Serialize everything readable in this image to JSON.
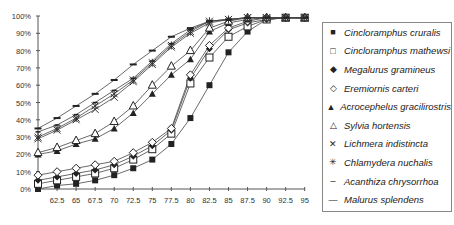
{
  "chart_data": {
    "type": "line",
    "title": "",
    "xlabel": "",
    "ylabel": "",
    "ylim": [
      0,
      100
    ],
    "grid": false,
    "legend_position": "right",
    "y_ticks": [
      "0%",
      "10%",
      "20%",
      "30%",
      "40%",
      "50%",
      "60%",
      "70%",
      "80%",
      "90%",
      "100%"
    ],
    "x": [
      60,
      62.5,
      65,
      67.5,
      70,
      72.5,
      75,
      77.5,
      80,
      82.5,
      85,
      87.5,
      90,
      92.5,
      95
    ],
    "x_tick_labels": [
      "62.5",
      "65",
      "67.5",
      "70",
      "72.5",
      "75",
      "77.5",
      "80",
      "82.5",
      "85",
      "87.5",
      "90",
      "92.5",
      "95"
    ],
    "series": [
      {
        "name": "Cincloramphus cruralis",
        "marker": "filled-square",
        "values": [
          0,
          2,
          3,
          5,
          8,
          12,
          17,
          26,
          41,
          60,
          79,
          91,
          98,
          99,
          99
        ]
      },
      {
        "name": "Cincloramphus mathewsi",
        "marker": "open-square",
        "values": [
          3,
          5,
          7,
          9,
          12,
          17,
          23,
          32,
          61,
          76,
          88,
          94,
          98,
          99,
          99
        ]
      },
      {
        "name": "Megalurus gramineus",
        "marker": "filled-diamond",
        "values": [
          5,
          7,
          9,
          11,
          14,
          19,
          25,
          34,
          64,
          81,
          92,
          96,
          98,
          99,
          99
        ]
      },
      {
        "name": "Eremiornis carteri",
        "marker": "open-diamond",
        "values": [
          8,
          10,
          12,
          14,
          16,
          21,
          27,
          35,
          66,
          83,
          93,
          97,
          99,
          99,
          99
        ]
      },
      {
        "name": "Acrocephelus gracilirostris",
        "marker": "filled-triangle",
        "values": [
          20,
          22,
          26,
          29,
          35,
          44,
          55,
          66,
          75,
          91,
          96,
          98,
          99,
          99,
          99
        ]
      },
      {
        "name": "Sylvia hortensis",
        "marker": "open-triangle",
        "values": [
          21,
          24,
          28,
          32,
          39,
          48,
          60,
          71,
          80,
          93,
          97,
          99,
          99,
          99,
          99
        ]
      },
      {
        "name": "Lichmera indistincta",
        "marker": "x",
        "values": [
          29,
          34,
          40,
          46,
          53,
          62,
          72,
          82,
          90,
          96,
          98,
          99,
          99,
          99,
          99
        ]
      },
      {
        "name": "Chlamydera nuchalis",
        "marker": "asterisk",
        "values": [
          30,
          35,
          41,
          48,
          55,
          63,
          73,
          83,
          91,
          97,
          98,
          99,
          99,
          99,
          99
        ]
      },
      {
        "name": "Acanthiza chrysorrhoa",
        "marker": "short-dash",
        "values": [
          33,
          37,
          43,
          50,
          57,
          64,
          74,
          84,
          92,
          97,
          98,
          99,
          99,
          99,
          99
        ]
      },
      {
        "name": "Malurus splendens",
        "marker": "dash",
        "values": [
          35,
          41,
          48,
          55,
          63,
          72,
          80,
          88,
          93,
          97,
          98,
          99,
          99,
          99,
          99
        ]
      }
    ]
  },
  "legend": {
    "items": [
      "Cincloramphus cruralis",
      "Cincloramphus mathewsi",
      "Megalurus gramineus",
      "Eremiornis carteri",
      "Acrocephelus gracilirostris",
      "Sylvia hortensis",
      "Lichmera indistincta",
      "Chlamydera nuchalis",
      "Acanthiza chrysorrhoa",
      "Malurus splendens"
    ],
    "markers": [
      "■",
      "□",
      "◆",
      "◇",
      "▲",
      "△",
      "✕",
      "✳",
      "–",
      "—"
    ]
  }
}
